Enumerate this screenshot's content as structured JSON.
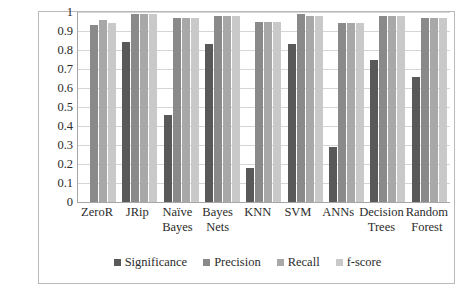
{
  "chart_data": {
    "type": "bar",
    "title": "",
    "subtitle": "",
    "xlabel": "",
    "ylabel": "",
    "ylim": [
      0,
      1
    ],
    "ytick_labels": [
      "1",
      "0.9",
      "0.8",
      "0.7",
      "0.6",
      "0.5",
      "0.4",
      "0.3",
      "0.2",
      "0.1",
      "0"
    ],
    "ytick_values": [
      1,
      0.9,
      0.8,
      0.7,
      0.6,
      0.5,
      0.4,
      0.3,
      0.2,
      0.1,
      0
    ],
    "grid": true,
    "legend_position": "bottom",
    "categories": [
      "ZeroR",
      "JRip",
      "Naïve Bayes",
      "Bayes Nets",
      "KNN",
      "SVM",
      "ANNs",
      "Decision Trees",
      "Random Forest"
    ],
    "series": [
      {
        "name": "Significance",
        "color": "#595959",
        "values": [
          null,
          0.84,
          0.46,
          0.83,
          0.18,
          0.83,
          0.29,
          0.75,
          0.66
        ]
      },
      {
        "name": "Precision",
        "color": "#8a8a8a",
        "values": [
          0.93,
          0.99,
          0.97,
          0.98,
          0.95,
          0.99,
          0.94,
          0.98,
          0.97
        ]
      },
      {
        "name": "Recall",
        "color": "#a8a8a8",
        "values": [
          0.96,
          0.99,
          0.97,
          0.98,
          0.95,
          0.98,
          0.94,
          0.98,
          0.97
        ]
      },
      {
        "name": "f-score",
        "color": "#c9c9c9",
        "values": [
          0.94,
          0.99,
          0.97,
          0.98,
          0.95,
          0.98,
          0.94,
          0.98,
          0.97
        ]
      }
    ]
  },
  "legend": {
    "items": [
      {
        "label": "Significance",
        "swatch": "s0"
      },
      {
        "label": "Precision",
        "swatch": "s1"
      },
      {
        "label": "Recall",
        "swatch": "s2"
      },
      {
        "label": "f-score",
        "swatch": "s3"
      }
    ]
  },
  "colors": {
    "significance": "#595959",
    "precision": "#8a8a8a",
    "recall": "#a8a8a8",
    "fscore": "#c9c9c9",
    "gridline": "#d6d6d6",
    "axis": "#a6a6a6",
    "frame": "#b9b9b9",
    "text": "#2b2b2b"
  }
}
